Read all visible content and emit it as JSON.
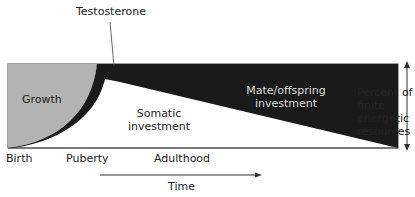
{
  "diagram": {
    "callout": "Testosterone",
    "regions": {
      "growth": "Growth",
      "somatic_line1": "Somatic",
      "somatic_line2": "investment",
      "mate_line1": "Mate/offspring",
      "mate_line2": "investment"
    },
    "stages": [
      "Birth",
      "Puberty",
      "Adulthood"
    ],
    "time_label": "Time",
    "axis_label": [
      "Percent of",
      "finite",
      "energetic",
      "resources"
    ],
    "colors": {
      "growth": "#b3b3b3",
      "mate": "#1a1a1a",
      "somatic": "#ffffff",
      "outline": "#333333"
    }
  }
}
